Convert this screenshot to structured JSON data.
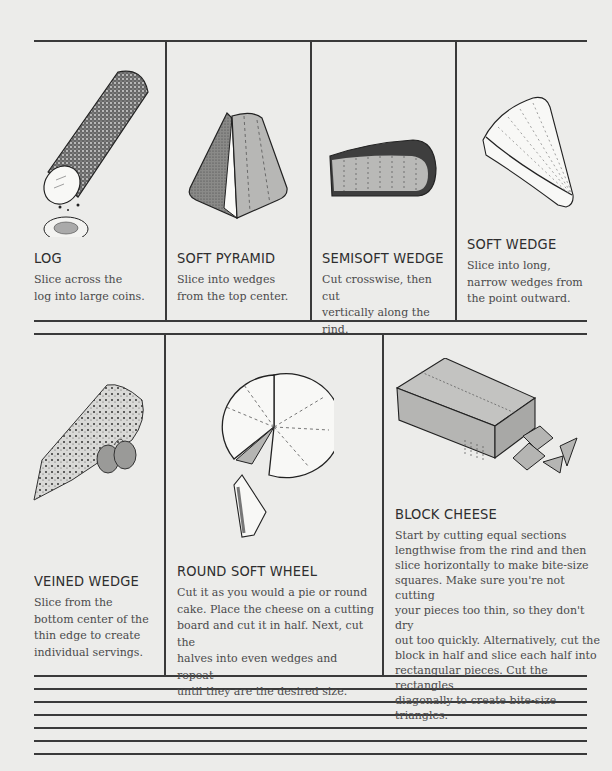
{
  "row1": [
    {
      "id": "log",
      "title": "LOG",
      "description": "Slice across the log into large coins.",
      "lines": [
        "Slice across the",
        "log into large coins."
      ],
      "icon": "log-cheese-icon"
    },
    {
      "id": "soft-pyramid",
      "title": "SOFT PYRAMID",
      "description": "Slice into wedges from the top center.",
      "lines": [
        "Slice into wedges",
        "from the top center."
      ],
      "icon": "pyramid-cheese-icon"
    },
    {
      "id": "semisoft-wedge",
      "title": "SEMISOFT WEDGE",
      "description": "Cut crosswise, then cut vertically along the rind.",
      "lines": [
        "Cut crosswise, then cut",
        "vertically along the rind."
      ],
      "icon": "semisoft-wedge-icon"
    },
    {
      "id": "soft-wedge",
      "title": "SOFT WEDGE",
      "description": "Slice into long, narrow wedges from the point outward.",
      "lines": [
        "Slice into long,",
        "narrow wedges from",
        "the point outward."
      ],
      "icon": "soft-wedge-icon"
    }
  ],
  "row2": [
    {
      "id": "veined-wedge",
      "title": "VEINED WEDGE",
      "lines": [
        "Slice from the",
        "bottom center of the",
        "thin edge to create",
        "individual servings."
      ],
      "icon": "veined-wedge-icon"
    },
    {
      "id": "round-soft-wheel",
      "title": "ROUND SOFT WHEEL",
      "lines": [
        "Cut it as you would a pie or round",
        "cake. Place the cheese on a cutting",
        "board and cut it in half. Next, cut the",
        "halves into even wedges and repeat",
        "until they are the desired size."
      ],
      "icon": "round-wheel-icon"
    },
    {
      "id": "block-cheese",
      "title": "BLOCK CHEESE",
      "lines": [
        "Start by cutting equal sections",
        "lengthwise from the rind and then",
        "slice horizontally to make bite-size",
        "squares. Make sure you're not cutting",
        "your pieces too thin, so they don't dry",
        "out too quickly. Alternatively, cut the",
        "block in half and slice each half into",
        "rectangular pieces. Cut the rectangles",
        "diagonally to create bite-size triangles."
      ],
      "icon": "block-cheese-icon"
    }
  ],
  "notes_lines": 7,
  "colors": {
    "background": "#ececea",
    "ink": "#3a3a3a",
    "fill_gray": "#b5b5b3",
    "rind_dark": "#3e3e3e"
  }
}
